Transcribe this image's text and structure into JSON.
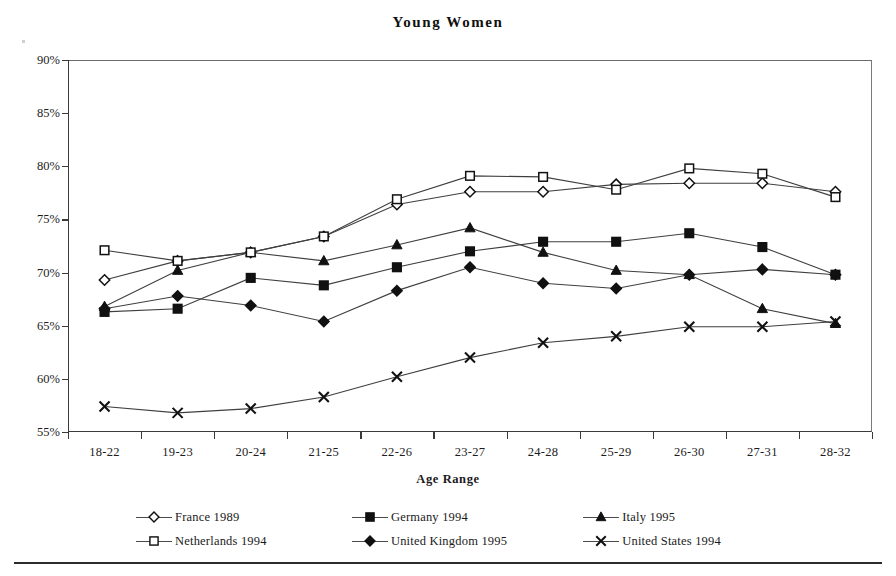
{
  "chart_data": {
    "type": "line",
    "title": "Young Women",
    "xlabel": "Age Range",
    "ylabel": "",
    "categories": [
      "18-22",
      "19-23",
      "20-24",
      "21-25",
      "22-26",
      "23-27",
      "24-28",
      "25-29",
      "26-30",
      "27-31",
      "28-32"
    ],
    "ylim": [
      55,
      90
    ],
    "ytick_labels": [
      "55%",
      "60%",
      "65%",
      "70%",
      "75%",
      "80%",
      "85%",
      "90%"
    ],
    "ytick_values": [
      55,
      60,
      65,
      70,
      75,
      80,
      85,
      90
    ],
    "grid": false,
    "legend_position": "bottom",
    "series": [
      {
        "name": "France 1989",
        "marker": "open-diamond",
        "values": [
          69.3,
          71.1,
          71.9,
          73.4,
          76.4,
          77.6,
          77.6,
          78.3,
          78.4,
          78.4,
          77.6
        ]
      },
      {
        "name": "Germany 1994",
        "marker": "filled-square",
        "values": [
          66.3,
          66.6,
          69.5,
          68.8,
          70.5,
          72.0,
          72.9,
          72.9,
          73.7,
          72.4,
          69.8
        ]
      },
      {
        "name": "Italy 1995",
        "marker": "filled-triangle",
        "values": [
          66.8,
          70.2,
          71.9,
          71.1,
          72.6,
          74.2,
          71.9,
          70.2,
          69.8,
          66.6,
          65.2
        ]
      },
      {
        "name": "Netherlands 1994",
        "marker": "open-square",
        "values": [
          72.1,
          71.1,
          71.9,
          73.4,
          76.9,
          79.1,
          79.0,
          77.8,
          79.8,
          79.3,
          77.1
        ]
      },
      {
        "name": "United Kingdom 1995",
        "marker": "filled-diamond",
        "values": [
          66.6,
          67.8,
          66.9,
          65.4,
          68.3,
          70.5,
          69.0,
          68.5,
          69.8,
          70.3,
          69.8
        ]
      },
      {
        "name": "United States 1994",
        "marker": "x-cross",
        "values": [
          57.4,
          56.8,
          57.2,
          58.3,
          60.2,
          62.0,
          63.4,
          64.0,
          64.9,
          64.9,
          65.4
        ]
      }
    ]
  },
  "legend": {
    "entries": [
      {
        "label": "France 1989"
      },
      {
        "label": "Germany 1994"
      },
      {
        "label": "Italy 1995"
      },
      {
        "label": "Netherlands 1994"
      },
      {
        "label": "United Kingdom 1995"
      },
      {
        "label": "United States 1994"
      }
    ]
  },
  "colors": {
    "line": "#3f3f3f",
    "marker_fill": "#111111",
    "marker_open_fill": "#ffffff",
    "axis": "#3a3a3a",
    "text": "#1a1a1a"
  }
}
